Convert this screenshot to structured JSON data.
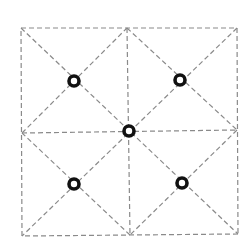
{
  "diagram": {
    "type": "square-grid-with-diagonals",
    "width": 251,
    "height": 242,
    "colors": {
      "line": "#8a8a8a",
      "node_stroke": "#111111",
      "node_fill": "#ffffff",
      "background": "#ffffff"
    },
    "dash_pattern": "5 3",
    "outer_square": {
      "top_left": [
        21,
        28
      ],
      "top_right": [
        237,
        28
      ],
      "bottom_right": [
        238,
        234
      ],
      "bottom_left": [
        22,
        236
      ]
    },
    "center": [
      129,
      131
    ],
    "edge_midpoints": {
      "top": [
        127,
        28
      ],
      "right": [
        237,
        130
      ],
      "bottom": [
        130,
        235
      ],
      "left": [
        22,
        133
      ]
    },
    "nodes": [
      {
        "name": "node-top-left",
        "cx": 74,
        "cy": 81,
        "r": 5
      },
      {
        "name": "node-top-right",
        "cx": 180,
        "cy": 80,
        "r": 5
      },
      {
        "name": "node-center",
        "cx": 129,
        "cy": 131,
        "r": 5
      },
      {
        "name": "node-bottom-left",
        "cx": 74,
        "cy": 184,
        "r": 5
      },
      {
        "name": "node-bottom-right",
        "cx": 182,
        "cy": 183,
        "r": 5
      }
    ]
  }
}
